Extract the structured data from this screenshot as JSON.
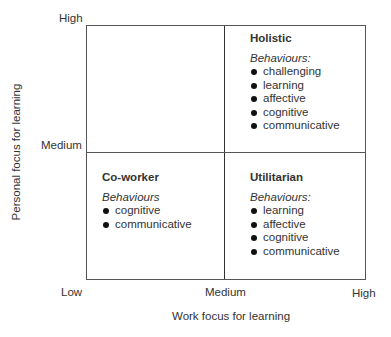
{
  "y_axis": {
    "title": "Personal focus for learning",
    "ticks": {
      "high": "High",
      "medium": "Medium"
    }
  },
  "x_axis": {
    "title": "Work focus for learning",
    "ticks": {
      "low": "Low",
      "medium": "Medium",
      "high": "High"
    }
  },
  "quadrants": {
    "top_left": {
      "title": "",
      "subtitle": "",
      "items": []
    },
    "top_right": {
      "title": "Holistic",
      "subtitle": "Behaviours:",
      "items": [
        "challenging",
        "learning",
        "affective",
        "cognitive",
        "communicative"
      ]
    },
    "bottom_left": {
      "title": "Co-worker",
      "subtitle": "Behaviours",
      "items": [
        "cognitive",
        "communicative"
      ]
    },
    "bottom_right": {
      "title": "Utilitarian",
      "subtitle": "Behaviours:",
      "items": [
        "learning",
        "affective",
        "cognitive",
        "communicative"
      ]
    }
  }
}
